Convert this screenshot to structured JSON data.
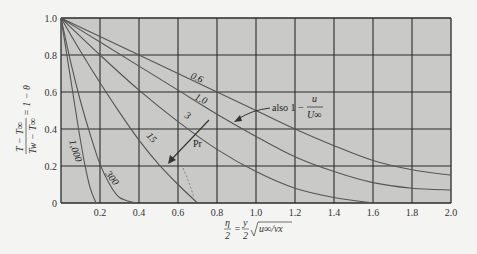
{
  "chart_data": {
    "type": "line",
    "title": "",
    "xlabel": "η/2 = (y/2)·√(u∞/νx)",
    "ylabel": "(T − T∞)/(Tw − T∞) = 1 − θ",
    "xlim": [
      0,
      2.0
    ],
    "ylim": [
      0,
      1.0
    ],
    "grid": true,
    "x_ticks": [
      "0.2",
      "0.4",
      "0.6",
      "0.8",
      "1.0",
      "1.2",
      "1.4",
      "1.6",
      "1.8",
      "2.0"
    ],
    "y_ticks": [
      "0",
      "0.2",
      "0.4",
      "0.6",
      "0.8",
      "1.0"
    ],
    "legend_title": "Pr",
    "series": [
      {
        "name": "0.6",
        "label": "0.6",
        "x": [
          0,
          0.2,
          0.4,
          0.6,
          0.8,
          1.0,
          1.2,
          1.4,
          1.6,
          1.8,
          2.0
        ],
        "y": [
          1.0,
          0.9,
          0.8,
          0.7,
          0.6,
          0.5,
          0.4,
          0.31,
          0.23,
          0.18,
          0.15
        ]
      },
      {
        "name": "1.0",
        "label": "1.0",
        "x": [
          0,
          0.2,
          0.4,
          0.6,
          0.8,
          1.0,
          1.2,
          1.4,
          1.6,
          1.8,
          2.0
        ],
        "y": [
          1.0,
          0.87,
          0.74,
          0.61,
          0.48,
          0.36,
          0.25,
          0.17,
          0.11,
          0.08,
          0.07
        ]
      },
      {
        "name": "3",
        "label": "3",
        "x": [
          0,
          0.2,
          0.4,
          0.6,
          0.8,
          1.0,
          1.2,
          1.4,
          1.6
        ],
        "y": [
          1.0,
          0.8,
          0.61,
          0.44,
          0.29,
          0.17,
          0.08,
          0.03,
          0.0
        ]
      },
      {
        "name": "15",
        "label": "15",
        "x": [
          0,
          0.1,
          0.2,
          0.3,
          0.4,
          0.5,
          0.6,
          0.7
        ],
        "y": [
          1.0,
          0.82,
          0.65,
          0.49,
          0.34,
          0.21,
          0.1,
          0.0
        ]
      },
      {
        "name": "300",
        "label": "300",
        "x": [
          0,
          0.05,
          0.1,
          0.15,
          0.2,
          0.25,
          0.3,
          0.38
        ],
        "y": [
          1.0,
          0.76,
          0.55,
          0.37,
          0.21,
          0.1,
          0.03,
          0.0
        ]
      },
      {
        "name": "1,000",
        "label": "1,000",
        "x": [
          0,
          0.03,
          0.06,
          0.09,
          0.12,
          0.15,
          0.18
        ],
        "y": [
          1.0,
          0.8,
          0.6,
          0.4,
          0.22,
          0.08,
          0.0
        ]
      }
    ],
    "annotations": [
      {
        "text": "also 1 − u/U∞",
        "points_to": "1.0"
      },
      {
        "text": "Pr",
        "arrow": "increasing Pr direction"
      }
    ]
  },
  "labels": {
    "ylabel_top": "T − T∞",
    "ylabel_bottom": "Tw − T∞",
    "ylabel_rhs": "= 1 − θ",
    "xlabel_frac_num": "η",
    "xlabel_frac_den": "2",
    "xlabel_eq": "=",
    "xlabel_y_num": "y",
    "xlabel_y_den": "2",
    "xlabel_sqrt": "u∞/νx",
    "also_text": "also 1 −",
    "also_num": "u",
    "also_den": "U∞",
    "pr_text": "Pr"
  },
  "colors": {
    "plot_bg": "#c9c9c7",
    "grid": "#2b2b2b",
    "curve": "#555555",
    "page_bg": "#f4f4f2"
  }
}
